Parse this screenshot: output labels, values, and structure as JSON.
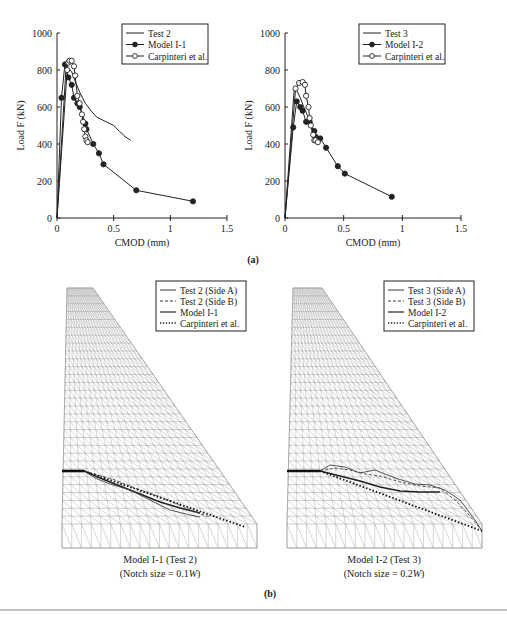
{
  "chart_data": [
    {
      "type": "line",
      "panel": "(a) left",
      "title": "",
      "xlabel": "CMOD (mm)",
      "ylabel": "Load F (kN)",
      "xlim": [
        0,
        1.5
      ],
      "ylim": [
        0,
        1000
      ],
      "xticks": [
        "0",
        "0.5",
        "1",
        "1.5"
      ],
      "yticks": [
        "0",
        "200",
        "400",
        "600",
        "800",
        "1000"
      ],
      "legend_position": "upper right",
      "series": [
        {
          "name": "Test 2",
          "marker": "none",
          "x": [
            0,
            0.08,
            0.1,
            0.13,
            0.16,
            0.2,
            0.25,
            0.3,
            0.35,
            0.4,
            0.45,
            0.5,
            0.55,
            0.6,
            0.65
          ],
          "y": [
            0,
            820,
            810,
            790,
            740,
            680,
            620,
            580,
            545,
            530,
            515,
            500,
            470,
            440,
            420
          ]
        },
        {
          "name": "Model I-1",
          "marker": "filled-circle",
          "x": [
            0,
            0.04,
            0.07,
            0.1,
            0.13,
            0.15,
            0.18,
            0.2,
            0.25,
            0.26,
            0.32,
            0.37,
            0.41,
            0.7,
            1.2
          ],
          "y": [
            0,
            650,
            830,
            760,
            720,
            650,
            620,
            600,
            510,
            480,
            400,
            350,
            290,
            150,
            90
          ]
        },
        {
          "name": "Carpinteri et al.",
          "marker": "open-circle",
          "x": [
            0,
            0.09,
            0.1,
            0.11,
            0.13,
            0.15,
            0.16,
            0.18,
            0.2,
            0.22,
            0.23,
            0.24,
            0.25,
            0.26,
            0.27
          ],
          "y": [
            0,
            800,
            840,
            850,
            850,
            820,
            770,
            660,
            620,
            560,
            520,
            480,
            440,
            420,
            410
          ]
        }
      ]
    },
    {
      "type": "line",
      "panel": "(a) right",
      "title": "",
      "xlabel": "CMOD (mm)",
      "ylabel": "Load F (kN)",
      "xlim": [
        0,
        1.5
      ],
      "ylim": [
        0,
        1000
      ],
      "xticks": [
        "0",
        "0.5",
        "1",
        "1.5"
      ],
      "yticks": [
        "0",
        "200",
        "400",
        "600",
        "800",
        "1000"
      ],
      "legend_position": "upper right",
      "series": [
        {
          "name": "Test 3",
          "marker": "none",
          "x": [
            0,
            0.08,
            0.1,
            0.13,
            0.16,
            0.2,
            0.24,
            0.28
          ],
          "y": [
            0,
            710,
            690,
            650,
            600,
            540,
            470,
            420
          ]
        },
        {
          "name": "Model I-2",
          "marker": "filled-circle",
          "x": [
            0,
            0.07,
            0.1,
            0.13,
            0.15,
            0.18,
            0.21,
            0.25,
            0.26,
            0.3,
            0.35,
            0.45,
            0.51,
            0.91
          ],
          "y": [
            0,
            490,
            630,
            600,
            580,
            520,
            520,
            470,
            440,
            430,
            380,
            280,
            240,
            115
          ]
        },
        {
          "name": "Carpinteri et al.",
          "marker": "open-circle",
          "x": [
            0,
            0.09,
            0.12,
            0.15,
            0.17,
            0.18,
            0.2,
            0.21,
            0.22,
            0.24,
            0.25,
            0.26,
            0.28
          ],
          "y": [
            0,
            700,
            730,
            735,
            720,
            660,
            600,
            540,
            500,
            450,
            420,
            420,
            410
          ]
        }
      ]
    }
  ],
  "panel_a_label": "(a)",
  "panel_b_label": "(b)",
  "mesh_left": {
    "legend": [
      "Test 2 (Side A)",
      "Test 2 (Side B)",
      "Model I-1",
      "Carpinteri et al."
    ],
    "caption_line1": "Model I-1 (Test 2)",
    "caption_line2_prefix": "(Notch size = 0.1",
    "caption_line2_italic": "W",
    "caption_line2_suffix": ")"
  },
  "mesh_right": {
    "legend": [
      "Test 3 (Side A)",
      "Test 3 (Side B)",
      "Model I-2",
      "Carpinteri et al."
    ],
    "caption_line1": "Model I-2 (Test 3)",
    "caption_line2_prefix": "(Notch size = 0.2",
    "caption_line2_italic": "W",
    "caption_line2_suffix": ")"
  },
  "colors": {
    "ink": "#222222",
    "mesh": "#9a9a9a",
    "rule": "#888888"
  }
}
